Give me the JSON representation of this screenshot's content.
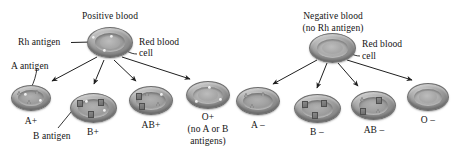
{
  "title_left": "Positive blood",
  "title_right_line1": "Negative blood",
  "title_right_line2": "(no Rh antigen)",
  "labels": {
    "rh_antigen": "Rh antigen",
    "a_antigen": "A antigen",
    "b_antigen": "B antigen",
    "red_blood_cell_line1": "Red blood",
    "red_blood_cell_line2": "cell"
  },
  "colors": {
    "ink": "#141414",
    "cell_mid": "#b9b9b9",
    "cell_edge": "#8e8e8e",
    "antigen_a": "#9c9c9c",
    "antigen_b": "#6e6e6e",
    "rh_dot": "#d8d8d8",
    "background": "#ffffff"
  },
  "positive_group": {
    "parent_cell": {
      "name": "positive-parent-red-blood-cell",
      "has_rh": true,
      "a_antigens": 0,
      "b_antigens": 0
    },
    "children": [
      {
        "label": "A+",
        "name": "cell-a-positive",
        "a_antigens": 3,
        "b_antigens": 0,
        "has_rh": true,
        "sublabel": ""
      },
      {
        "label": "B+",
        "name": "cell-b-positive",
        "a_antigens": 0,
        "b_antigens": 3,
        "has_rh": true,
        "sublabel": ""
      },
      {
        "label": "AB+",
        "name": "cell-ab-positive",
        "a_antigens": 2,
        "b_antigens": 2,
        "has_rh": true,
        "sublabel": ""
      },
      {
        "label": "O+",
        "name": "cell-o-positive",
        "a_antigens": 0,
        "b_antigens": 0,
        "has_rh": true,
        "sublabel_line1": "(no A or B",
        "sublabel_line2": "antigens)"
      }
    ]
  },
  "negative_group": {
    "parent_cell": {
      "name": "negative-parent-red-blood-cell",
      "has_rh": false,
      "a_antigens": 0,
      "b_antigens": 0
    },
    "children": [
      {
        "label": "A –",
        "name": "cell-a-negative",
        "a_antigens": 3,
        "b_antigens": 0,
        "has_rh": false
      },
      {
        "label": "B –",
        "name": "cell-b-negative",
        "a_antigens": 0,
        "b_antigens": 3,
        "has_rh": false
      },
      {
        "label": "AB –",
        "name": "cell-ab-negative",
        "a_antigens": 2,
        "b_antigens": 2,
        "has_rh": false
      },
      {
        "label": "O –",
        "name": "cell-o-negative",
        "a_antigens": 0,
        "b_antigens": 0,
        "has_rh": false
      }
    ]
  }
}
